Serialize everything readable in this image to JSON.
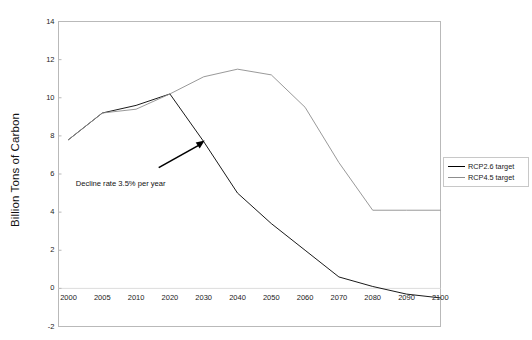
{
  "chart_data": {
    "type": "line",
    "title": "",
    "xlabel": "",
    "ylabel": "Billion Tons of Carbon",
    "categories": [
      "2000",
      "2005",
      "2010",
      "2020",
      "2030",
      "2040",
      "2050",
      "2060",
      "2070",
      "2080",
      "2090",
      "2100"
    ],
    "x": [
      2000,
      2005,
      2010,
      2020,
      2030,
      2040,
      2050,
      2060,
      2070,
      2080,
      2090,
      2100
    ],
    "xlim": [
      2000,
      2100
    ],
    "ylim": [
      -2,
      14
    ],
    "yticks": [
      -2,
      0,
      2,
      4,
      6,
      8,
      10,
      12,
      14
    ],
    "ytick_labels": [
      "-2",
      "0",
      "2",
      "4",
      "6",
      "8",
      "10",
      "12",
      "14"
    ],
    "grid": false,
    "legend_position": "right",
    "series": [
      {
        "name": "RCP2.6 target",
        "color": "#000000",
        "values": [
          7.8,
          9.2,
          9.6,
          10.2,
          7.7,
          5.0,
          3.4,
          2.0,
          0.6,
          0.1,
          -0.3,
          -0.5
        ]
      },
      {
        "name": "RCP4.5 target",
        "color": "#8d8d8d",
        "values": [
          7.8,
          9.2,
          9.4,
          10.2,
          11.1,
          11.5,
          11.2,
          9.5,
          6.6,
          4.1,
          4.1,
          4.1
        ]
      }
    ],
    "annotations": [
      {
        "text": "Decline rate 3.5% per year",
        "type": "arrow-label",
        "points_to_x": 2030,
        "points_to_y": 7.7
      }
    ]
  },
  "legend": {
    "items": [
      {
        "label": "RCP2.6 target"
      },
      {
        "label": "RCP4.5 target"
      }
    ]
  }
}
